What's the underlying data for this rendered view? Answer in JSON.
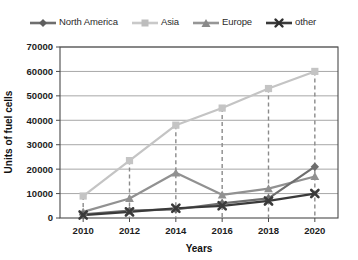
{
  "chart_data": {
    "type": "line",
    "title": "",
    "xlabel": "Years",
    "ylabel": "Units of fuel cells",
    "categories": [
      "2010",
      "2012",
      "2014",
      "2016",
      "2018",
      "2020"
    ],
    "x": [
      2010,
      2012,
      2014,
      2016,
      2018,
      2020
    ],
    "ylim": [
      0,
      70000
    ],
    "yticks": [
      "0",
      "10000",
      "20000",
      "30000",
      "40000",
      "50000",
      "60000",
      "70000"
    ],
    "ytick_values": [
      0,
      10000,
      20000,
      30000,
      40000,
      50000,
      60000,
      70000
    ],
    "grid": "horizontal",
    "legend_position": "top",
    "series": [
      {
        "name": "North America",
        "color": "#6e6e6e",
        "marker": "diamond",
        "values": [
          1500,
          3000,
          3500,
          6000,
          8000,
          21000
        ]
      },
      {
        "name": "Asia",
        "color": "#c4c4c4",
        "marker": "square",
        "values": [
          9000,
          23500,
          38000,
          45000,
          53000,
          60000
        ]
      },
      {
        "name": "Europe",
        "color": "#919191",
        "marker": "triangle",
        "values": [
          2500,
          8000,
          18500,
          9500,
          12000,
          17000
        ]
      },
      {
        "name": "other",
        "color": "#3a3a3a",
        "marker": "cross",
        "values": [
          1200,
          2500,
          4000,
          5000,
          7000,
          10000
        ]
      }
    ],
    "annotations": {
      "dropline_series": "Asia",
      "dropline_style": "dashed",
      "dropline_color": "#8a8a8a"
    }
  },
  "legend": {
    "items": [
      {
        "label": "North America"
      },
      {
        "label": "Asia"
      },
      {
        "label": "Europe"
      },
      {
        "label": "other"
      }
    ]
  },
  "axes": {
    "y_title": "Units of fuel cells",
    "x_title": "Years"
  }
}
